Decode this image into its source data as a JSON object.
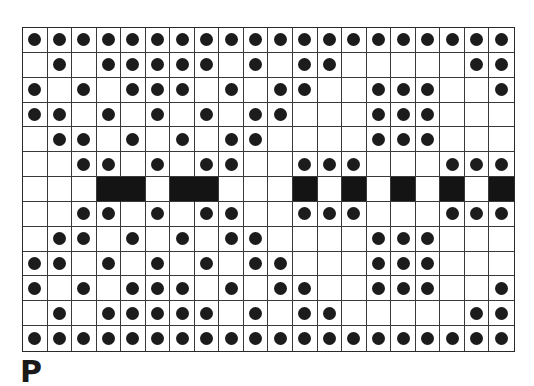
{
  "figure": {
    "label": "P",
    "grid": {
      "columns": 20,
      "rows": 13,
      "legend": {
        "o": "empty cell",
        "x": "cell with black dot",
        "B": "solid black cell"
      },
      "pattern": [
        "xxxxxxxxxxxxxxxxxxxx",
        "oxoxxxxxoxoxxoooooxx",
        "xoxoxxxoxoxxooxxxoox",
        "xxoxoxoxoxxoooxxxooo",
        "oxxoxoxoxxooooxxxooo",
        "ooxxoxoxxooxxxoooxxx",
        "oooBBoBBoooBoBoBoBoB",
        "ooxxoxoxxooxxxoooxxx",
        "oxxoxoxoxxooooxxxooo",
        "xxoxoxoxoxxoooxxxooo",
        "xoxoxxxoxoxxooxxxoox",
        "oxoxxxxxoxoxxoooooxx",
        "xxxxxxxxxxxxxxxxxxxx"
      ],
      "merged_black_runs": [
        {
          "row": 6,
          "from_col": 3,
          "to_col": 4
        },
        {
          "row": 6,
          "from_col": 6,
          "to_col": 7
        }
      ]
    },
    "colors": {
      "line": "#3a3a3a",
      "dot": "#1c1c1c",
      "block": "#141414",
      "background": "#ffffff"
    }
  }
}
